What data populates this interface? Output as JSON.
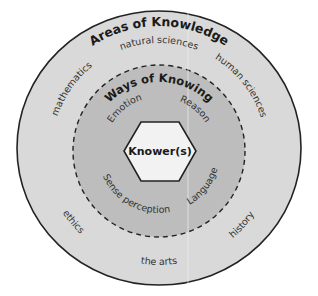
{
  "diagram": {
    "outer_ring": {
      "title": "Areas of Knowledge",
      "items": [
        "natural sciences",
        "human sciences",
        "history",
        "the arts",
        "ethics",
        "mathematics"
      ]
    },
    "inner_ring": {
      "title": "Ways of Knowing",
      "items": [
        "Emotion",
        "Reason",
        "Language",
        "Sense perception"
      ]
    },
    "center": {
      "label": "Knower(s)"
    },
    "colors": {
      "outer_fill": "#d9d9d9",
      "inner_fill": "#bdbdbd",
      "center_fill": "#f2f2f2",
      "stroke": "#222222",
      "divider": "#f5f5f5"
    }
  }
}
